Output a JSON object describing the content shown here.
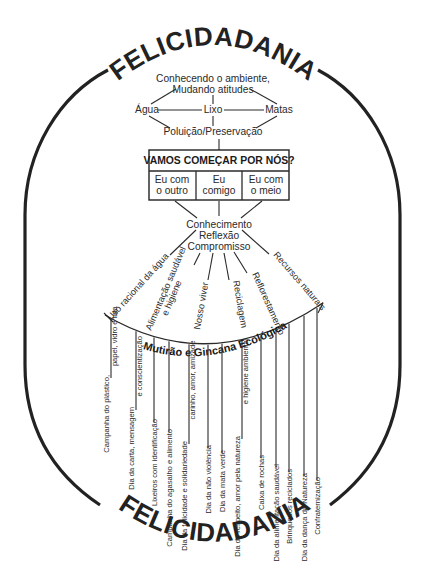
{
  "title_top": "FELICIDADANIA",
  "title_bottom": "FELICIDADANIA",
  "top_cluster": {
    "center_line1": "Conhecendo o ambiente,",
    "center_line2": "Mudando atitudes",
    "left": "Água",
    "middle": "Lixo",
    "right": "Matas",
    "bottom": "Poluição/Preservação"
  },
  "box": {
    "header": "VAMOS COMEÇAR POR NÓS?",
    "cells": [
      {
        "line1": "Eu com",
        "line2": "o outro"
      },
      {
        "line1": "Eu",
        "line2": "comigo"
      },
      {
        "line1": "Eu com",
        "line2": "o meio"
      }
    ]
  },
  "hub": {
    "line1": "Conhecimento",
    "line2": "Reflexão",
    "line3": "Compromisso"
  },
  "themes": [
    {
      "line1": "Uso racional da água",
      "line2": ""
    },
    {
      "line1": "Alimentação saudável",
      "line2": "e higiene"
    },
    {
      "line1": "Nosso viver",
      "line2": ""
    },
    {
      "line1": "Reciclagem",
      "line2": ""
    },
    {
      "line1": "Reflorestamento",
      "line2": ""
    },
    {
      "line1": "Recursos naturais",
      "line2": ""
    }
  ],
  "event_arc_label": "Mutirão e Gincana Ecológica",
  "activities": [
    {
      "line1": "Campanha do plástico,",
      "line2": "papel, vidro e lata"
    },
    {
      "line1": "Dia da carta, mensagem",
      "line2": "e conscientização"
    },
    {
      "line1": "Lixeiros com identificação",
      "line2": ""
    },
    {
      "line1": "Campanha do agasalho e alimento",
      "line2": ""
    },
    {
      "line1": "Dia da felicidade e solidariedade",
      "line2": "carinho, amor, amizade"
    },
    {
      "line1": "Dia da não violência",
      "line2": ""
    },
    {
      "line1": "Dia da mata verde",
      "line2": ""
    },
    {
      "line1": "Dia do respeito, amor pela natureza",
      "line2": "e higiene ambiental"
    },
    {
      "line1": "Caixa de rochas",
      "line2": ""
    },
    {
      "line1": "Dia da alimentação saudável",
      "line2": ""
    },
    {
      "line1": "Brinquedos reciclados",
      "line2": ""
    },
    {
      "line1": "Dia da dança da Natureza",
      "line2": ""
    },
    {
      "line1": "Confraternização",
      "line2": ""
    }
  ]
}
